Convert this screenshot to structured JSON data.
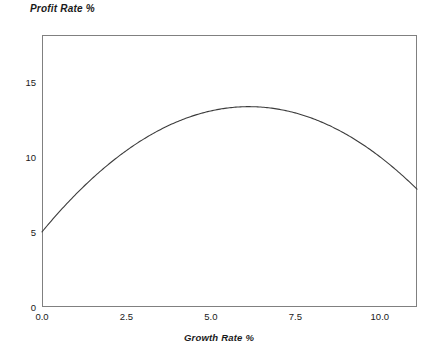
{
  "chart_data": {
    "type": "line",
    "title": "Profit Rate %",
    "xlabel": "Growth Rate %",
    "ylabel": "Profit Rate %",
    "xlim": [
      0.0,
      11.1
    ],
    "ylim": [
      0,
      18.1
    ],
    "xticks": [
      "0.0",
      "2.5",
      "5.0",
      "7.5",
      "10.0"
    ],
    "xtick_values": [
      0.0,
      2.5,
      5.0,
      7.5,
      10.0
    ],
    "yticks": [
      "0",
      "5",
      "10",
      "15"
    ],
    "ytick_values": [
      0,
      5,
      10,
      15
    ],
    "grid": false,
    "legend": "none",
    "series": [
      {
        "name": "Profit Rate",
        "color": "#3c3c3c",
        "x": [
          0.0,
          0.5,
          1.0,
          1.5,
          2.0,
          2.5,
          3.0,
          3.5,
          4.0,
          4.5,
          5.0,
          5.5,
          6.0,
          6.5,
          7.0,
          7.5,
          8.0,
          8.5,
          9.0,
          9.5,
          10.0,
          10.5,
          11.0,
          11.1
        ],
        "values": [
          5.0,
          6.3,
          7.5,
          8.6,
          9.7,
          10.7,
          11.6,
          12.2,
          12.7,
          13.05,
          12.95,
          13.2,
          13.25,
          13.2,
          12.95,
          12.6,
          12.1,
          11.5,
          10.75,
          9.8,
          8.75,
          7.6,
          6.2,
          5.6
        ]
      }
    ],
    "curve_fit": {
      "form": "y = a + b*x + c*x^2",
      "a": 5.0,
      "b": 2.72,
      "c": -0.222,
      "vertex_x": 6.1,
      "vertex_y": 13.25,
      "x_start": 0.0,
      "y_start": 5.0,
      "x_end": 11.1,
      "y_end": 5.6
    }
  },
  "axis_style": {
    "frame_color": "#808080",
    "curve_color": "#3c3c3c",
    "background": "#ffffff"
  }
}
